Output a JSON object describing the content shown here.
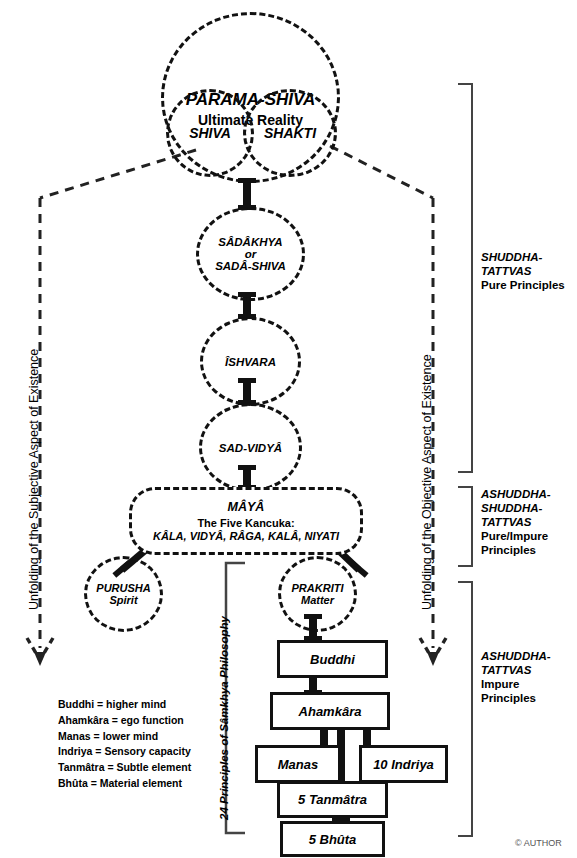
{
  "diagram": {
    "title_circle": {
      "name": "PARAMA-SHIVA",
      "subtitle": "Ultimate Reality",
      "left_lobe": "SHIVA",
      "right_lobe": "SHAKTI"
    },
    "pure_tattvas": [
      {
        "line1": "SÂDÂKHYA",
        "line2": "or",
        "line3": "SADÂ-SHIVA"
      },
      {
        "line1": "ÎSHVARA",
        "line2": "",
        "line3": ""
      },
      {
        "line1": "SAD-VIDYÂ",
        "line2": "",
        "line3": ""
      }
    ],
    "maya": {
      "title": "MÂYÂ",
      "line2": "The Five Kancuka:",
      "line3": "KÂLA, VIDYÂ, RÂGA, KALÂ, NIYATI"
    },
    "purusha": {
      "line1": "PURUSHA",
      "line2": "Spirit"
    },
    "prakriti": {
      "line1": "PRAKRITI",
      "line2": "Matter"
    },
    "samkhya_boxes": [
      {
        "label": "Buddhi"
      },
      {
        "label": "Ahamkâra"
      },
      {
        "label": "Manas"
      },
      {
        "label": "10 Indriya"
      },
      {
        "label": "5 Tanmâtra"
      },
      {
        "label": "5 Bhûta"
      }
    ],
    "samkhya_bracket_label": "24 Principles of Sâmkhya Philosophy",
    "left_axis_label": "Unfolding of the Subjective Aspect of Existence",
    "right_axis_label": "Unfolding of the Objective Aspect of Existence",
    "groups": [
      {
        "title_line1": "SHUDDHA-",
        "title_line2": "TATTVAS",
        "subtitle_line1": "Pure Principles",
        "subtitle_line2": ""
      },
      {
        "title_line1": "ASHUDDHA-",
        "title_line2": "SHUDDHA-",
        "title_line3": "TATTVAS",
        "subtitle_line1": "Pure/Impure",
        "subtitle_line2": "Principles"
      },
      {
        "title_line1": "ASHUDDHA-",
        "title_line2": "TATTVAS",
        "subtitle_line1": "Impure",
        "subtitle_line2": "Principles"
      }
    ],
    "legend": "Buddhi = higher mind\nAhamkâra = ego function\nManas = lower mind\nIndriya = Sensory capacity\nTanmâtra = Subtle element\nBhûta = Material element",
    "copyright": "© AUTHOR",
    "colors": {
      "ink": "#111111",
      "paper": "#ffffff",
      "muted": "#555555"
    }
  }
}
